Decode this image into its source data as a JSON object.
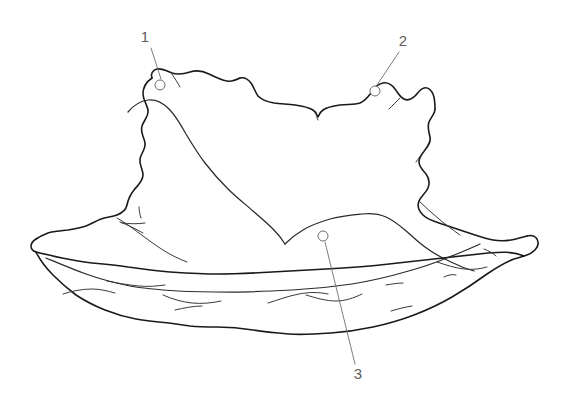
{
  "figure": {
    "type": "technical-line-drawing",
    "background_color": "#ffffff",
    "outline_color": "#1a1a1a",
    "leader_color": "#6e6e6e",
    "label_color": "#5c5c5c",
    "width": 566,
    "height": 418
  },
  "callouts": [
    {
      "id": "1",
      "label": "1",
      "label_x": 145,
      "label_y": 38,
      "marker_x": 160,
      "marker_y": 85,
      "marker_r": 5,
      "leader_x1": 151,
      "leader_y1": 48,
      "leader_x2": 161,
      "leader_y2": 79
    },
    {
      "id": "2",
      "label": "2",
      "label_x": 403,
      "label_y": 42,
      "marker_x": 375,
      "marker_y": 91,
      "marker_r": 5,
      "leader_x1": 399,
      "leader_y1": 52,
      "leader_x2": 377,
      "leader_y2": 85
    },
    {
      "id": "3",
      "label": "3",
      "label_x": 358,
      "label_y": 375,
      "marker_x": 323,
      "marker_y": 236,
      "marker_r": 5,
      "leader_x1": 355,
      "leader_y1": 364,
      "leader_x2": 325,
      "leader_y2": 242
    }
  ]
}
